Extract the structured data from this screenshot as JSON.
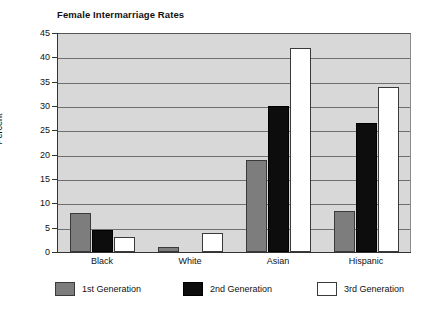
{
  "chart_data": {
    "type": "bar",
    "title": "Female Intermarriage Rates",
    "xlabel": "",
    "ylabel": "Percent",
    "ylim": [
      0,
      45
    ],
    "ytick_step": 5,
    "yticks": [
      0,
      5,
      10,
      15,
      20,
      25,
      30,
      35,
      40,
      45
    ],
    "grid": true,
    "legend_position": "bottom",
    "categories": [
      "Black",
      "White",
      "Asian",
      "Hispanic"
    ],
    "series": [
      {
        "name": "1st Generation",
        "color": "#7d7d7d",
        "values": [
          8,
          1,
          19,
          8.5
        ]
      },
      {
        "name": "2nd Generation",
        "color": "#0d0d0d",
        "values": [
          4.5,
          0,
          30,
          26.5
        ]
      },
      {
        "name": "3rd Generation",
        "color": "#ffffff",
        "values": [
          3,
          4,
          42,
          34
        ]
      }
    ]
  },
  "plot": {
    "background_color": "#d8d8d8",
    "gridline_color": "#6f6f6f",
    "axis_color": "#333333"
  }
}
